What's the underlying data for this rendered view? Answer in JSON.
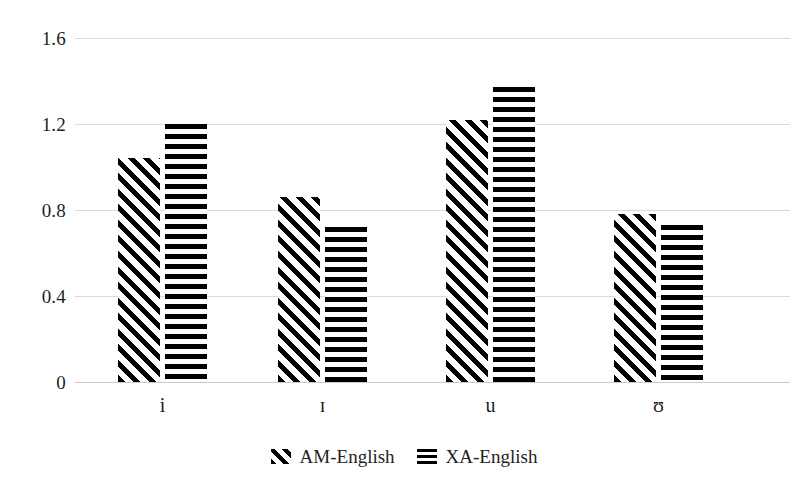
{
  "chart_data": {
    "type": "bar",
    "title": "",
    "subtitle": "",
    "xlabel": "",
    "ylabel": "",
    "categories": [
      "i",
      "ɪ",
      "u",
      "ʊ"
    ],
    "series": [
      {
        "name": "AM-English",
        "pattern": "diagonal-hatch",
        "values": [
          1.04,
          0.86,
          1.22,
          0.78
        ]
      },
      {
        "name": "XA-English",
        "pattern": "horizontal-stripes",
        "values": [
          1.2,
          0.72,
          1.37,
          0.73
        ]
      }
    ],
    "ylim": [
      0,
      1.6
    ],
    "ytick_labels": [
      "0",
      "0.4",
      "0.8",
      "1.2",
      "1.6"
    ],
    "ytick_values": [
      0,
      0.4,
      0.8,
      1.2,
      1.6
    ],
    "grid": true,
    "legend_position": "bottom-center",
    "annotations": []
  },
  "yaxis": {
    "ticks": [
      {
        "label": "1.6",
        "value": 1.6
      },
      {
        "label": "1.2",
        "value": 1.2
      },
      {
        "label": "0.8",
        "value": 0.8
      },
      {
        "label": "0.4",
        "value": 0.4
      },
      {
        "label": "0",
        "value": 0
      }
    ]
  },
  "xaxis": {
    "ticks": [
      {
        "label": "i"
      },
      {
        "label": "ɪ"
      },
      {
        "label": "u"
      },
      {
        "label": "ʊ"
      }
    ]
  },
  "legend": {
    "entries": [
      {
        "label": "AM-English",
        "swatch": "diagonal-hatch-swatch"
      },
      {
        "label": "XA-English",
        "swatch": "horizontal-stripes-swatch"
      }
    ]
  },
  "colors": {
    "background": "#ffffff",
    "ink": "#000000",
    "text": "#1f1f1f",
    "gridline": "#d9d9d9",
    "baseline": "#c8c8c8"
  }
}
